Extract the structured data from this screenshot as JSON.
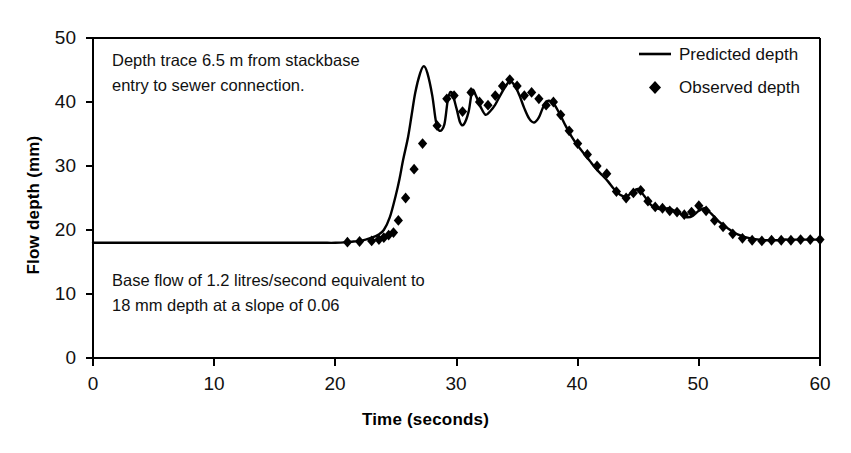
{
  "chart_data": {
    "type": "line",
    "title": "",
    "xlabel": "Time (seconds)",
    "ylabel": "Flow depth (mm)",
    "xlim": [
      0,
      60
    ],
    "ylim": [
      0,
      50
    ],
    "xticks": [
      0,
      10,
      20,
      30,
      40,
      50,
      60
    ],
    "yticks": [
      0,
      10,
      20,
      30,
      40,
      50
    ],
    "grid": false,
    "legend_position": "top-right",
    "series": [
      {
        "name": "Predicted depth",
        "marker": "line",
        "x": [
          0,
          2,
          4,
          6,
          8,
          10,
          12,
          14,
          16,
          18,
          19,
          20,
          21,
          21.5,
          22,
          22.5,
          23,
          23.5,
          24,
          24.5,
          25,
          25.3,
          25.6,
          26,
          26.3,
          26.6,
          27,
          27.3,
          27.6,
          28,
          28.3,
          28.6,
          29,
          29.3,
          29.6,
          30,
          30.3,
          30.6,
          31,
          31.3,
          31.6,
          32,
          32.4,
          32.8,
          33.2,
          33.6,
          34,
          34.4,
          34.8,
          35.2,
          35.6,
          36,
          36.4,
          36.8,
          37.2,
          37.6,
          38,
          38.5,
          39,
          39.5,
          40,
          40.5,
          41,
          41.5,
          42,
          42.5,
          43,
          43.5,
          44,
          44.5,
          45,
          45.5,
          46,
          46.5,
          47,
          47.5,
          48,
          48.5,
          49,
          49.5,
          50,
          50.5,
          51,
          51.5,
          52,
          52.5,
          53,
          53.5,
          54,
          54.5,
          55,
          55.5,
          56,
          56.5,
          57,
          57.5,
          58,
          58.5,
          59,
          59.5,
          60
        ],
        "y": [
          18.0,
          18.0,
          18.0,
          18.0,
          18.0,
          18.0,
          18.0,
          18.0,
          18.0,
          18.0,
          18.0,
          18.0,
          18.1,
          18.2,
          18.3,
          18.5,
          18.8,
          19.2,
          20.0,
          22.0,
          25.5,
          28.0,
          31.0,
          34.5,
          38.0,
          41.5,
          44.5,
          45.6,
          44.5,
          41.0,
          37.0,
          35.5,
          36.5,
          40.5,
          41.5,
          39.0,
          36.8,
          36.5,
          38.5,
          41.8,
          41.0,
          39.2,
          38.0,
          38.6,
          39.6,
          41.0,
          42.3,
          43.2,
          42.6,
          41.0,
          39.0,
          37.4,
          36.8,
          37.6,
          39.4,
          40.2,
          39.8,
          38.2,
          36.3,
          34.6,
          33.2,
          32.0,
          30.8,
          29.6,
          28.6,
          27.6,
          26.4,
          25.5,
          25.2,
          25.9,
          26.4,
          25.3,
          24.0,
          23.4,
          23.2,
          23.4,
          23.0,
          22.5,
          22.0,
          22.2,
          23.0,
          23.4,
          22.6,
          21.6,
          20.8,
          20.1,
          19.5,
          19.1,
          18.8,
          18.6,
          18.5,
          18.4,
          18.4,
          18.4,
          18.5,
          18.5,
          18.5,
          18.5,
          18.5,
          18.5,
          18.5
        ]
      },
      {
        "name": "Observed depth",
        "marker": "diamond",
        "x": [
          21.0,
          22.0,
          23.0,
          23.6,
          24.0,
          24.4,
          24.8,
          25.2,
          25.8,
          26.5,
          27.2,
          28.4,
          29.2,
          29.8,
          30.5,
          31.2,
          31.9,
          32.6,
          33.2,
          33.8,
          34.4,
          35.0,
          35.6,
          36.2,
          36.8,
          37.4,
          38.0,
          38.6,
          39.3,
          40.0,
          40.8,
          41.6,
          42.4,
          43.2,
          44.0,
          44.6,
          45.2,
          45.8,
          46.4,
          47.0,
          47.6,
          48.2,
          48.8,
          49.4,
          50.0,
          50.6,
          51.3,
          52.0,
          52.8,
          53.6,
          54.4,
          55.2,
          56.0,
          56.8,
          57.6,
          58.4,
          59.2,
          60.0
        ],
        "y": [
          18.1,
          18.2,
          18.3,
          18.5,
          18.8,
          19.2,
          19.6,
          21.5,
          25.0,
          29.5,
          33.5,
          36.3,
          40.5,
          41.0,
          38.5,
          41.5,
          40.0,
          39.5,
          41.0,
          42.5,
          43.5,
          42.5,
          41.0,
          41.5,
          40.5,
          39.5,
          40.0,
          38.0,
          35.5,
          33.5,
          31.8,
          30.0,
          28.8,
          26.0,
          25.0,
          25.8,
          26.2,
          24.5,
          23.6,
          23.4,
          23.0,
          22.8,
          22.4,
          22.8,
          23.8,
          23.0,
          21.5,
          20.5,
          19.4,
          18.7,
          18.4,
          18.3,
          18.4,
          18.4,
          18.4,
          18.5,
          18.5,
          18.5
        ]
      }
    ],
    "annotations": [
      {
        "id": "annotation-top",
        "lines": [
          "Depth trace 6.5 m from stackbase",
          "entry to sewer connection."
        ]
      },
      {
        "id": "annotation-bottom",
        "lines": [
          "Base flow of 1.2 litres/second equivalent to",
          "18 mm depth at a slope of 0.06"
        ]
      }
    ]
  },
  "axes": {
    "x_title": "Time (seconds)",
    "y_title": "Flow depth (mm)",
    "x_tick_labels": [
      "0",
      "10",
      "20",
      "30",
      "40",
      "50",
      "60"
    ],
    "y_tick_labels": [
      "0",
      "10",
      "20",
      "30",
      "40",
      "50"
    ]
  },
  "legend": {
    "entries": [
      {
        "label": "Predicted depth",
        "marker": "line"
      },
      {
        "label": "Observed depth",
        "marker": "diamond"
      }
    ]
  },
  "annotations": {
    "top_line1": "Depth trace 6.5 m from stackbase",
    "top_line2": "entry to sewer connection.",
    "bottom_line1": "Base flow of 1.2 litres/second equivalent to",
    "bottom_line2": "18 mm depth at a slope of 0.06"
  },
  "colors": {
    "line": "#000000",
    "marker": "#000000",
    "axis": "#000000",
    "text": "#111111",
    "background": "#ffffff"
  }
}
